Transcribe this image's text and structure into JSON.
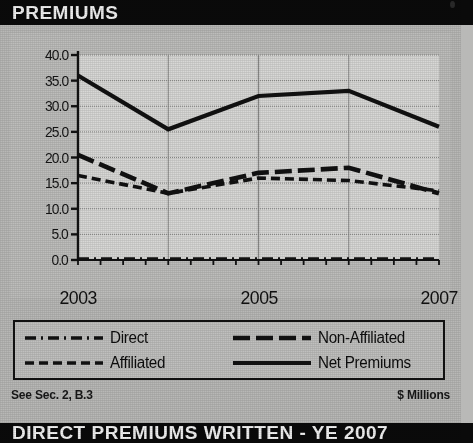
{
  "header": {
    "title": "PREMIUMS"
  },
  "footer": {
    "title": "DIRECT PREMIUMS WRITTEN - YE 2007"
  },
  "footnote": {
    "source_ref": "See Sec. 2, B.3",
    "units": "$ Millions"
  },
  "colors": {
    "banner_bg": "#0a0a0a",
    "banner_text": "#f2f2f2",
    "page_bg": "#b8b8b6",
    "plot_bg": "#d8d8d6",
    "series_ink": "#111111",
    "gridline": "#8d8d8b",
    "axis": "#111111"
  },
  "legend": {
    "items": [
      {
        "label": "Direct",
        "style": "dash-dot",
        "icon": "dash-dot-line-icon"
      },
      {
        "label": "Non-Affiliated",
        "style": "long-dash",
        "icon": "long-dash-line-icon"
      },
      {
        "label": "Affiliated",
        "style": "dashed",
        "icon": "dashed-line-icon"
      },
      {
        "label": "Net Premiums",
        "style": "solid",
        "icon": "solid-line-icon"
      }
    ]
  },
  "chart_data": {
    "type": "line",
    "title": "PREMIUMS",
    "subtitle": "DIRECT PREMIUMS WRITTEN - YE 2007",
    "xlabel": "",
    "ylabel": "",
    "units": "$ Millions",
    "x": [
      2003,
      2004,
      2005,
      2006,
      2007
    ],
    "x_tick_labels": [
      "2003",
      "2005",
      "2007"
    ],
    "x_tick_values": [
      2003,
      2005,
      2007
    ],
    "xlim": [
      2003,
      2007
    ],
    "ylim": [
      0.0,
      40.0
    ],
    "y_tick_labels": [
      "40.0",
      "35.0",
      "30.0",
      "25.0",
      "20.0",
      "15.0",
      "10.0",
      "5.0",
      "0.0"
    ],
    "y_tick_values": [
      40.0,
      35.0,
      30.0,
      25.0,
      20.0,
      15.0,
      10.0,
      5.0,
      0.0
    ],
    "grid": true,
    "legend_position": "below-plot",
    "series": [
      {
        "name": "Net Premiums",
        "style": "solid",
        "values": [
          36.0,
          25.5,
          32.0,
          33.0,
          26.0
        ]
      },
      {
        "name": "Non-Affiliated",
        "style": "long-dash",
        "values": [
          20.5,
          13.0,
          17.0,
          18.0,
          13.0
        ]
      },
      {
        "name": "Affiliated",
        "style": "dashed",
        "values": [
          16.5,
          13.0,
          16.0,
          15.5,
          13.5
        ]
      },
      {
        "name": "Direct",
        "style": "dash-dot",
        "values": [
          0.2,
          0.2,
          0.2,
          0.2,
          0.2
        ]
      }
    ]
  }
}
